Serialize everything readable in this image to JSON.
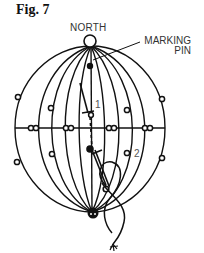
{
  "figure": {
    "label": "Fig. 7",
    "north_label": "NORTH",
    "marking_pin_label": "MARKING PIN",
    "marker_1": "1",
    "marker_2": "2"
  },
  "colors": {
    "ink": "#111111",
    "text": "#333333"
  }
}
